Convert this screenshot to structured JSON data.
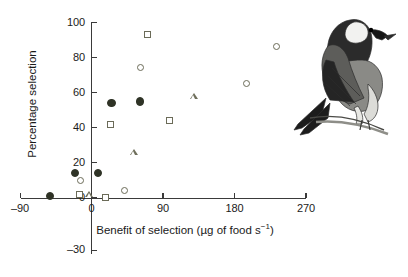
{
  "chart_data": {
    "type": "scatter",
    "title": "",
    "xlabel": "Benefit of selection (µg of food s⁻¹)",
    "ylabel": "Percentage selection",
    "xlim": [
      -90,
      270
    ],
    "ylim": [
      -30,
      100
    ],
    "xticks": [
      -90,
      0,
      90,
      180,
      270
    ],
    "xtick_labels": [
      "–90",
      "0",
      "90",
      "180",
      "270"
    ],
    "yticks": [
      -30,
      0,
      20,
      40,
      60,
      80,
      100
    ],
    "ytick_labels": [
      "–30",
      "0",
      "20",
      "40",
      "60",
      "80",
      "100"
    ],
    "grid": false,
    "legend": null,
    "series": [
      {
        "name": "filled-circle",
        "marker": "circle-filled",
        "points": [
          {
            "x": -52,
            "y": 1
          },
          {
            "x": -21,
            "y": 14
          },
          {
            "x": 8,
            "y": 14
          },
          {
            "x": 25,
            "y": 54
          },
          {
            "x": 61,
            "y": 55
          }
        ]
      },
      {
        "name": "open-circle",
        "marker": "circle-open",
        "points": [
          {
            "x": -14,
            "y": 10
          },
          {
            "x": 42,
            "y": 4
          },
          {
            "x": 62,
            "y": 74
          },
          {
            "x": 195,
            "y": 65
          },
          {
            "x": 233,
            "y": 86
          }
        ]
      },
      {
        "name": "open-square",
        "marker": "square-open",
        "points": [
          {
            "x": -15,
            "y": 2
          },
          {
            "x": 18,
            "y": 0
          },
          {
            "x": 24,
            "y": 42
          },
          {
            "x": 70,
            "y": 93
          },
          {
            "x": 98,
            "y": 44
          }
        ]
      },
      {
        "name": "open-triangle",
        "marker": "triangle-open",
        "points": [
          {
            "x": -3,
            "y": 2
          },
          {
            "x": 53,
            "y": 26
          },
          {
            "x": 129,
            "y": 58
          }
        ]
      }
    ]
  },
  "illustration": {
    "name": "bird-illustration",
    "description": "Perched chickadee bird on a branch"
  },
  "colors": {
    "axis": "#3a3a3a",
    "marker_open": "#6b6b58",
    "marker_filled": "#2f3326",
    "background": "#ffffff",
    "text": "#1a1a1a"
  }
}
